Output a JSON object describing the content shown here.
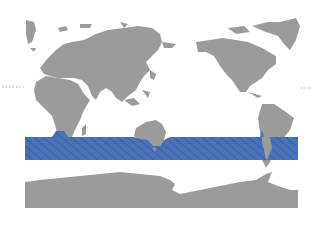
{
  "map": {
    "projection": "Pacific-centered world map",
    "land_color": "#9b9b9b",
    "ocean_color": "#ffffff",
    "highlight_band": {
      "label": "Southern Ocean band",
      "fill_color": "#4a72b8",
      "hatch_color": "#3a5d9c",
      "pattern": "diagonal hatch"
    },
    "markers": {
      "left_dotted_line_color": "#7fb6cf",
      "right_dotted_line_color": "#7fb6cf"
    }
  }
}
